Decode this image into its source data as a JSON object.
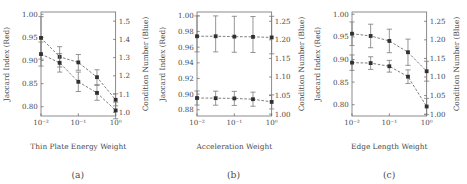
{
  "figure": {
    "panel_count": 3,
    "marker_color": "#303030",
    "line_color": "#5c5c5c",
    "axis_color": "#6f6f6f"
  },
  "panels": [
    {
      "caption": "(a)",
      "xlabel": "Thin Plate Energy Weight",
      "ylabel_left": "Jaccard Index (Red)",
      "ylabel_right": "Condition Number (Blue)"
    },
    {
      "caption": "(b)",
      "xlabel": "Acceleration Weight",
      "ylabel_left": "Jaccard Index (Red)",
      "ylabel_right": "Condition Number (Blue)"
    },
    {
      "caption": "(c)",
      "xlabel": "Edge Length Weight",
      "ylabel_left": "Jaccard Index (Red)",
      "ylabel_right": "Condition Number (Blue)"
    }
  ],
  "chart_data": [
    {
      "type": "line",
      "title": "",
      "panel": "(a)",
      "xlabel": "Thin Plate Energy Weight",
      "ylabel": "Jaccard Index (Red)",
      "ylabel_right": "Condition Number (Blue)",
      "xscale": "log",
      "x": [
        0.01,
        0.0316,
        0.1,
        0.316,
        1.0
      ],
      "xticks": [
        0.01,
        0.1,
        1.0
      ],
      "xtick_labels": [
        "10⁻²",
        "10⁻¹",
        "10⁰"
      ],
      "ylim": [
        0.78,
        1.005
      ],
      "yticks": [
        0.8,
        0.85,
        0.9,
        0.95,
        1.0
      ],
      "ytick_labels": [
        "0.80",
        "0.85",
        "0.90",
        "0.95",
        "1.00"
      ],
      "ylim_right": [
        0.98,
        1.55
      ],
      "yticks_right": [
        1.0,
        1.1,
        1.2,
        1.3,
        1.4,
        1.5
      ],
      "ytick_labels_right": [
        "1.0",
        "1.1",
        "1.2",
        "1.3",
        "1.4",
        "1.5"
      ],
      "grid": false,
      "legend": "none",
      "series": [
        {
          "name": "Jaccard Index (Red)",
          "axis": "left",
          "values": [
            0.949,
            0.908,
            0.896,
            0.864,
            0.815
          ],
          "yerr_up": [
            0.046,
            0.022,
            0.017,
            0.016,
            0.013
          ],
          "yerr_down": [
            0.046,
            0.022,
            0.017,
            0.016,
            0.013
          ]
        },
        {
          "name": "Condition Number (Blue)",
          "axis": "left_mapped",
          "values": [
            0.914,
            0.895,
            0.854,
            0.83,
            0.792
          ],
          "yerr_up": [
            0.026,
            0.02,
            0.021,
            0.016,
            0.018
          ],
          "yerr_down": [
            0.026,
            0.02,
            0.021,
            0.016,
            0.018
          ]
        }
      ]
    },
    {
      "type": "line",
      "title": "",
      "panel": "(b)",
      "xlabel": "Acceleration Weight",
      "ylabel": "Jaccard Index (Red)",
      "ylabel_right": "Condition Number (Blue)",
      "xscale": "log",
      "x": [
        0.01,
        0.0316,
        0.1,
        0.316,
        1.0
      ],
      "xticks": [
        0.01,
        0.1,
        1.0
      ],
      "xtick_labels": [
        "10⁻²",
        "10⁻¹",
        "10⁰"
      ],
      "ylim": [
        0.872,
        1.005
      ],
      "yticks": [
        0.88,
        0.9,
        0.92,
        0.94,
        0.96,
        0.98,
        1.0
      ],
      "ytick_labels": [
        "0.88",
        "0.90",
        "0.92",
        "0.94",
        "0.96",
        "0.98",
        "1.00"
      ],
      "ylim_right": [
        0.995,
        1.275
      ],
      "yticks_right": [
        1.0,
        1.05,
        1.1,
        1.15,
        1.2,
        1.25
      ],
      "ytick_labels_right": [
        "1.00",
        "1.05",
        "1.10",
        "1.15",
        "1.20",
        "1.25"
      ],
      "grid": false,
      "legend": "none",
      "series": [
        {
          "name": "Jaccard Index (Red)",
          "axis": "left",
          "values": [
            0.974,
            0.974,
            0.9735,
            0.9732,
            0.9725
          ],
          "yerr_up": [
            0.026,
            0.026,
            0.026,
            0.026,
            0.027
          ],
          "yerr_down": [
            0.02,
            0.02,
            0.02,
            0.02,
            0.021
          ]
        },
        {
          "name": "Condition Number (Blue)",
          "axis": "left_mapped",
          "values": [
            0.895,
            0.8948,
            0.8945,
            0.8935,
            0.89
          ],
          "yerr_up": [
            0.009,
            0.009,
            0.009,
            0.009,
            0.009
          ],
          "yerr_down": [
            0.009,
            0.009,
            0.009,
            0.009,
            0.009
          ]
        }
      ]
    },
    {
      "type": "line",
      "title": "",
      "panel": "(c)",
      "xlabel": "Edge Length Weight",
      "ylabel": "Jaccard Index (Red)",
      "ylabel_right": "Condition Number (Blue)",
      "xscale": "log",
      "x": [
        0.01,
        0.0316,
        0.1,
        0.316,
        1.0
      ],
      "xticks": [
        0.01,
        0.1,
        1.0
      ],
      "xtick_labels": [
        "10⁻²",
        "10⁻¹",
        "10⁰"
      ],
      "ylim": [
        0.775,
        1.005
      ],
      "yticks": [
        0.8,
        0.85,
        0.9,
        0.95,
        1.0
      ],
      "ytick_labels": [
        "0.80",
        "0.85",
        "0.90",
        "0.95",
        "1.00"
      ],
      "ylim_right": [
        0.995,
        1.275
      ],
      "yticks_right": [
        1.0,
        1.05,
        1.1,
        1.15,
        1.2,
        1.25
      ],
      "ytick_labels_right": [
        "1.00",
        "1.05",
        "1.10",
        "1.15",
        "1.20",
        "1.25"
      ],
      "grid": false,
      "legend": "none",
      "series": [
        {
          "name": "Jaccard Index (Red)",
          "axis": "left",
          "values": [
            0.957,
            0.952,
            0.941,
            0.916,
            0.874
          ],
          "yerr_up": [
            0.026,
            0.026,
            0.026,
            0.029,
            0.022
          ],
          "yerr_down": [
            0.026,
            0.026,
            0.026,
            0.029,
            0.022
          ]
        },
        {
          "name": "Condition Number (Blue)",
          "axis": "left_mapped",
          "values": [
            0.893,
            0.892,
            0.885,
            0.862,
            0.796
          ],
          "yerr_up": [
            0.017,
            0.014,
            0.013,
            0.015,
            0.018
          ],
          "yerr_down": [
            0.017,
            0.014,
            0.013,
            0.015,
            0.018
          ]
        }
      ]
    }
  ]
}
